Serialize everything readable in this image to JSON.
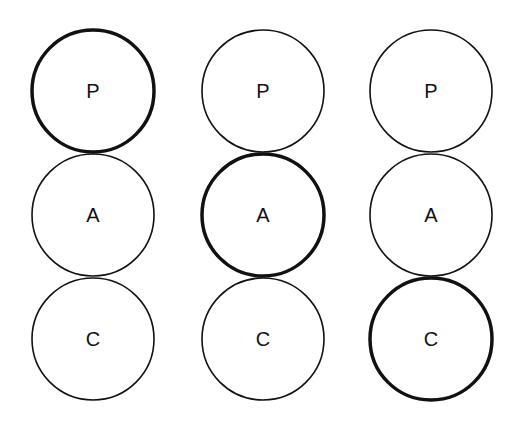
{
  "diagram": {
    "stroke_color": "#111111",
    "columns": [
      {
        "circles": [
          {
            "label": "P",
            "highlighted": true
          },
          {
            "label": "A",
            "highlighted": false
          },
          {
            "label": "C",
            "highlighted": false
          }
        ]
      },
      {
        "circles": [
          {
            "label": "P",
            "highlighted": false
          },
          {
            "label": "A",
            "highlighted": true
          },
          {
            "label": "C",
            "highlighted": false
          }
        ]
      },
      {
        "circles": [
          {
            "label": "P",
            "highlighted": false
          },
          {
            "label": "A",
            "highlighted": false
          },
          {
            "label": "C",
            "highlighted": true
          }
        ]
      }
    ]
  }
}
